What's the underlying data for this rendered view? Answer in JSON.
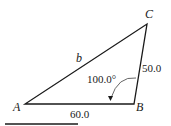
{
  "diagram": {
    "type": "triangle",
    "vertices": {
      "A": {
        "label": "A"
      },
      "B": {
        "label": "B"
      },
      "C": {
        "label": "C"
      }
    },
    "sides": {
      "AC": {
        "label": "b"
      },
      "BC": {
        "label": "50.0"
      },
      "AB": {
        "label": "60.0"
      }
    },
    "angle_B": {
      "label": "100.0°"
    }
  }
}
